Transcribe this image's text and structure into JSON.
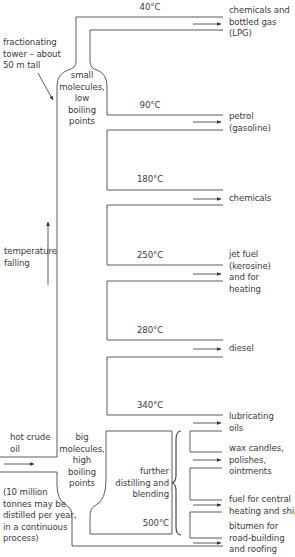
{
  "diagram": {
    "tower_label": [
      "fractionating",
      "tower – about",
      "50 m tall"
    ],
    "top_zone_label": [
      "small",
      "molecules,",
      "low",
      "boiling",
      "points"
    ],
    "bottom_zone_label": [
      "big",
      "molecules,",
      "high",
      "boiling",
      "points"
    ],
    "temperature_label": [
      "temperature",
      "falling"
    ],
    "input_label": [
      "hot crude",
      "oil"
    ],
    "input_note": [
      "(10 million",
      "tonnes may be",
      "distilled per year,",
      "in a continuous",
      "process)"
    ],
    "residue_label": [
      "further",
      "distilling and",
      "blending"
    ],
    "temperatures": [
      "40°C",
      "90°C",
      "180°C",
      "250°C",
      "280°C",
      "340°C",
      "500°C"
    ],
    "products": [
      [
        "chemicals and",
        "bottled gas",
        "(LPG)"
      ],
      [
        "petrol",
        "(gasoline)"
      ],
      [
        "chemicals"
      ],
      [
        "jet fuel",
        "(kerosine)",
        "and for",
        "heating"
      ],
      [
        "diesel"
      ],
      [
        "lubricating",
        "oils"
      ],
      [
        "wax candles,",
        "polishes,",
        "ointments"
      ],
      [
        "fuel for central",
        "heating and ships"
      ],
      [
        "bitumen for",
        "road-building",
        "and roofing"
      ]
    ],
    "line_color": "#4a4a4a"
  }
}
